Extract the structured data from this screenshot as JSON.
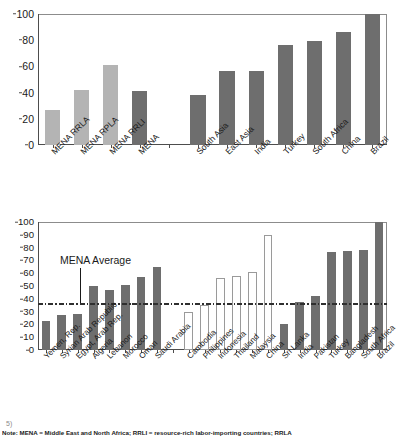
{
  "figure": {
    "note_label": "Note:",
    "note_text": " MENA = Middle East and North Africa; RRLI = resource-rich labor-importing countries; RRLA",
    "stray_glyph": "5)"
  },
  "chart_data": [
    {
      "id": "chart-top",
      "type": "bar",
      "title": "",
      "xlabel": "",
      "ylabel": "",
      "ylim": [
        0,
        100
      ],
      "yticks": [
        0,
        20,
        40,
        60,
        80,
        100
      ],
      "grid": false,
      "legend": "none",
      "categories": [
        "MENA RRLA",
        "MENA RPLA",
        "MENA RRLI",
        "MENA",
        "",
        "South Asia",
        "East Asia",
        "India",
        "Turkey",
        "South Africa",
        "China",
        "Brazil"
      ],
      "values": [
        27,
        42,
        61,
        41,
        null,
        38.5,
        56.5,
        56.5,
        76.5,
        79.5,
        86.5,
        100
      ],
      "bar_styles": [
        "light",
        "light",
        "light",
        "dark",
        "gap",
        "dark",
        "dark",
        "dark",
        "dark",
        "dark",
        "dark",
        "dark"
      ]
    },
    {
      "id": "chart-bottom",
      "type": "bar",
      "title": "",
      "xlabel": "",
      "ylabel": "",
      "ylim": [
        0,
        100
      ],
      "yticks": [
        0,
        10,
        20,
        30,
        40,
        50,
        60,
        70,
        80,
        90,
        100
      ],
      "grid": false,
      "legend": "none",
      "annotation": {
        "label": "MENA Average",
        "value": 36.5
      },
      "categories": [
        "Yemen, Rep.",
        "Syrian Arab Republic",
        "Egypt, Arab Rep.",
        "Algeria",
        "Lebanon",
        "Morocco",
        "Oman",
        "Saudi Arabia",
        "",
        "Cambodia",
        "Philippines",
        "Indonesia",
        "Thailand",
        "Malaysia",
        "China",
        "Sri Lanka",
        "India",
        "Pakistan",
        "Turkey",
        "Bangladesh",
        "South Africa",
        "Brazil"
      ],
      "values": [
        23,
        27,
        28,
        50,
        47,
        51,
        57,
        64.5,
        null,
        30,
        35,
        56.5,
        58,
        61,
        89.5,
        20.5,
        37.5,
        42.5,
        76.5,
        77.5,
        78.5,
        100
      ],
      "bar_styles": [
        "dark",
        "dark",
        "dark",
        "dark",
        "dark",
        "dark",
        "dark",
        "dark",
        "gap",
        "hollow",
        "hollow",
        "hollow",
        "hollow",
        "hollow",
        "hollow",
        "dark",
        "dark",
        "dark",
        "dark",
        "dark",
        "dark",
        "dark"
      ]
    }
  ],
  "colors": {
    "bar_dark": "#6e6e6e",
    "bar_light": "#b4b4b4",
    "bar_hollow_border": "#9a9a9a",
    "axis": "#4d4d4d",
    "refline": "#3a3a3a",
    "text": "#1a1a1a"
  }
}
